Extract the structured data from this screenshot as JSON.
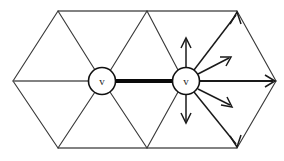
{
  "figure": {
    "background_color": "#ffffff",
    "width": 284,
    "height": 161
  },
  "vertices": [
    {
      "id": "vertex-left",
      "label": "v",
      "cx": 102,
      "cy": 81,
      "r": 13.5,
      "fill": "#ffffff",
      "stroke": "#111111"
    },
    {
      "id": "vertex-right",
      "label": "v",
      "cx": 186,
      "cy": 81,
      "r": 13.5,
      "fill": "#ffffff",
      "stroke": "#111111"
    }
  ],
  "highlighted_edge": {
    "id": "thick-edge",
    "from": "vertex-left",
    "to": "vertex-right",
    "color": "#0a0a0a",
    "width": 4.2,
    "x1": 116,
    "y1": 81,
    "x2": 172,
    "y2": 81
  },
  "mesh": {
    "stroke_color": "#3a3a3a",
    "outline_points": [
      {
        "x": 13,
        "y": 81
      },
      {
        "x": 58,
        "y": 11
      },
      {
        "x": 147,
        "y": 11
      },
      {
        "x": 237,
        "y": 11
      },
      {
        "x": 276,
        "y": 81
      },
      {
        "x": 237,
        "y": 148
      },
      {
        "x": 147,
        "y": 148
      },
      {
        "x": 58,
        "y": 148
      }
    ],
    "interior_edges": [
      {
        "x1": 13,
        "y1": 81,
        "x2": 276,
        "y2": 81
      },
      {
        "x1": 58,
        "y1": 11,
        "x2": 102,
        "y2": 81
      },
      {
        "x1": 147,
        "y1": 11,
        "x2": 102,
        "y2": 81
      },
      {
        "x1": 147,
        "y1": 11,
        "x2": 186,
        "y2": 81
      },
      {
        "x1": 237,
        "y1": 11,
        "x2": 186,
        "y2": 81
      },
      {
        "x1": 58,
        "y1": 148,
        "x2": 102,
        "y2": 81
      },
      {
        "x1": 147,
        "y1": 148,
        "x2": 102,
        "y2": 81
      },
      {
        "x1": 147,
        "y1": 148,
        "x2": 186,
        "y2": 81
      },
      {
        "x1": 237,
        "y1": 148,
        "x2": 186,
        "y2": 81
      }
    ]
  },
  "arrows": [
    {
      "id": "arrow-up",
      "direction": "up",
      "x1": 186,
      "y1": 67,
      "x2": 186,
      "y2": 38,
      "head": "open"
    },
    {
      "id": "arrow-up-right-short",
      "direction": "up-right",
      "x1": 197,
      "y1": 74,
      "x2": 230,
      "y2": 58,
      "head": "open"
    },
    {
      "id": "arrow-right",
      "direction": "right",
      "x1": 200,
      "y1": 81,
      "x2": 274,
      "y2": 81,
      "head": "open"
    },
    {
      "id": "arrow-down-right-short",
      "direction": "down-right",
      "x1": 197,
      "y1": 89,
      "x2": 231,
      "y2": 105,
      "head": "open"
    },
    {
      "id": "arrow-down",
      "direction": "down",
      "x1": 186,
      "y1": 95,
      "x2": 186,
      "y2": 123,
      "head": "open"
    },
    {
      "id": "arrow-up-right-long",
      "direction": "up-right-to-corner",
      "x1": 194,
      "y1": 70,
      "x2": 236,
      "y2": 14,
      "head": "open"
    },
    {
      "id": "arrow-down-right-long",
      "direction": "down-right-to-corner",
      "x1": 194,
      "y1": 92,
      "x2": 236,
      "y2": 145,
      "head": "open"
    }
  ]
}
